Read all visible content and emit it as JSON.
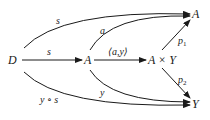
{
  "diagram": {
    "nodes": {
      "D": "D",
      "A_mid": "A",
      "AxY": "A × Y",
      "A_top": "A",
      "Y_bot": "Y"
    },
    "edges": {
      "D_to_A_top": "s",
      "D_to_A_mid": "s",
      "A_mid_to_A_top": "a",
      "A_mid_to_AxY": "⟨a,y⟩",
      "AxY_to_A_top": "p",
      "AxY_to_A_top_sub": "1",
      "AxY_to_Y": "p",
      "AxY_to_Y_sub": "2",
      "A_mid_to_Y": "y",
      "D_to_Y": "y ∘ s"
    }
  }
}
